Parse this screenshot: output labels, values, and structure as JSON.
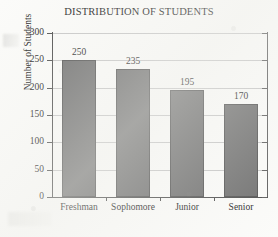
{
  "chart_data": {
    "type": "bar",
    "title": "DISTRIBUTION OF STUDENTS",
    "xlabel": "",
    "ylabel": "Number of Students",
    "categories": [
      "Freshman",
      "Sophomore",
      "Junior",
      "Senior"
    ],
    "values": [
      250,
      235,
      195,
      170
    ],
    "value_labels": [
      "250",
      "235",
      "195",
      "170"
    ],
    "ylim": [
      0,
      300
    ],
    "yticks": [
      0,
      50,
      100,
      150,
      200,
      250,
      300
    ],
    "ytick_labels": [
      "0",
      "50",
      "100",
      "150",
      "200",
      "250",
      "300"
    ],
    "grid": "horizontal",
    "legend": "none",
    "series": [
      {
        "name": "Number of Students",
        "values": [
          250,
          235,
          195,
          170
        ]
      }
    ],
    "colors": {
      "bar_fill": "#6e6e6e",
      "bar_outline": "#4f4f4f",
      "grid_line": "#c6c6c6",
      "axis": "#4a4a4a",
      "text": "#1c1c1c",
      "background": "#fbfbf9"
    }
  }
}
